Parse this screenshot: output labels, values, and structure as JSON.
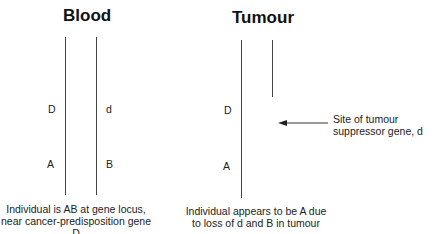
{
  "blood": {
    "title": "Blood",
    "left_chromosome": {
      "upper_label": "D",
      "lower_label": "A"
    },
    "right_chromosome": {
      "upper_label": "d",
      "lower_label": "B"
    },
    "caption_line1": "Individual is AB at gene locus,",
    "caption_line2": "near cancer-predisposition gene D"
  },
  "tumour": {
    "title": "Tumour",
    "left_chromosome": {
      "upper_label": "D",
      "lower_label": "A"
    },
    "right_chromosome": {
      "note": "truncated"
    },
    "arrow_note_line1": "Site of tumour",
    "arrow_note_line2": "suppressor gene, d",
    "caption_line1": "Individual appears to be A due",
    "caption_line2": "to loss of d and B in tumour"
  },
  "colors": {
    "line": "#444444",
    "text": "#222222",
    "title": "#111111"
  }
}
